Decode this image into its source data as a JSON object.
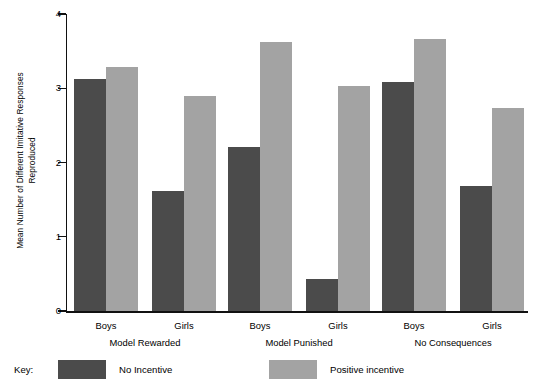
{
  "chart_data": {
    "type": "bar",
    "title": "",
    "xlabel": "",
    "ylabel_line1": "Mean Number of Different Imitative Responses",
    "ylabel_line2": "Reproduced",
    "ylim": [
      0,
      4
    ],
    "yticks": [
      "0",
      "1",
      "2",
      "3",
      "4"
    ],
    "ytick_values": [
      0,
      1,
      2,
      3,
      4
    ],
    "grid": false,
    "legend_position": "bottom-left",
    "groups": [
      "Model Rewarded",
      "Model Punished",
      "No Consequences"
    ],
    "subcategories": [
      "Boys",
      "Girls"
    ],
    "categories": [
      "Model Rewarded - Boys",
      "Model Rewarded - Girls",
      "Model Punished - Boys",
      "Model Punished - Girls",
      "No Consequences - Boys",
      "No Consequences - Girls"
    ],
    "series": [
      {
        "name": "No Incentive",
        "color": "#4b4b4b",
        "values": [
          3.13,
          1.61,
          2.21,
          0.43,
          3.09,
          1.68
        ]
      },
      {
        "name": "Positive incentive",
        "color": "#a3a3a3",
        "values": [
          3.28,
          2.89,
          3.62,
          3.03,
          3.67,
          2.73
        ]
      }
    ]
  },
  "legend": {
    "key_label": "Key:",
    "items": [
      {
        "label": "No Incentive",
        "color": "#4b4b4b"
      },
      {
        "label": "Positive incentive",
        "color": "#a3a3a3"
      }
    ]
  },
  "colors": {
    "no_incentive": "#4b4b4b",
    "positive_incentive": "#a3a3a3",
    "axis": "#111111",
    "background": "#ffffff"
  }
}
